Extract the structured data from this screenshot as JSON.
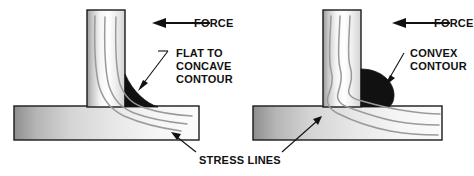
{
  "figure": {
    "background_color": "#ffffff",
    "width": 474,
    "height": 176
  },
  "colors": {
    "outline": "#1a1a1a",
    "weld_fill": "#111111",
    "stress_line": "#9a9a9a",
    "steel_light": "#fdfdfd",
    "steel_mid": "#d6d6d6",
    "steel_dark": "#8e8e8e",
    "text": "#111111",
    "arrow": "#111111"
  },
  "panels": [
    {
      "id": "left-panel",
      "name": "flat-to-concave-weld-panel",
      "weld_type": "concave",
      "force_label": "FORCE",
      "contour_label_lines": [
        "FLAT TO",
        "CONCAVE",
        "CONTOUR"
      ],
      "contour_label_text": "FLAT TO CONCAVE CONTOUR",
      "vertical_member": {
        "x": 87,
        "y": 10,
        "width": 38,
        "height": 98
      },
      "base_plate": {
        "x": 14,
        "y": 106,
        "width": 185,
        "height": 34
      },
      "stress_line_count": 3
    },
    {
      "id": "right-panel",
      "name": "convex-weld-panel",
      "weld_type": "convex",
      "force_label": "FORCE",
      "contour_label_lines": [
        "CONVEX",
        "CONTOUR"
      ],
      "contour_label_text": "CONVEX CONTOUR",
      "vertical_member": {
        "x": 323,
        "y": 10,
        "width": 38,
        "height": 98
      },
      "base_plate": {
        "x": 253,
        "y": 106,
        "width": 189,
        "height": 34
      },
      "stress_line_count": 3
    }
  ],
  "shared": {
    "stress_lines_label": "STRESS LINES"
  }
}
